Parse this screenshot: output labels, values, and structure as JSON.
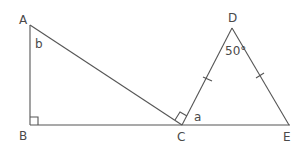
{
  "diagram": {
    "points": {
      "A": "A",
      "B": "B",
      "C": "C",
      "D": "D",
      "E": "E"
    },
    "angle_labels": {
      "b": "b",
      "a": "a",
      "d": "50°"
    },
    "line_color": "#555555"
  }
}
